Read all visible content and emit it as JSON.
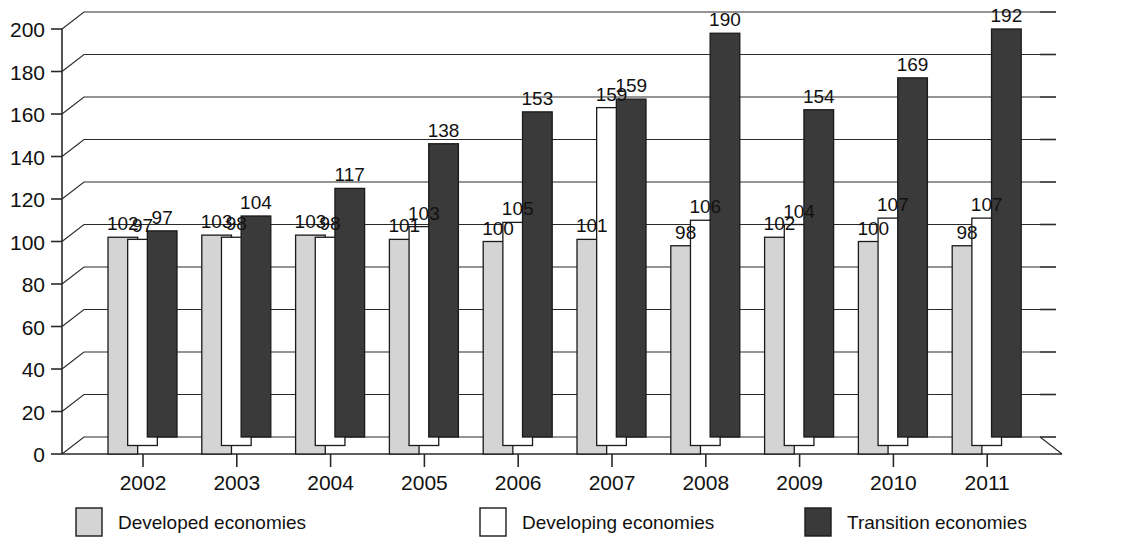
{
  "chart_data": {
    "type": "bar",
    "title": "",
    "subtitle": "",
    "xlabel": "",
    "ylabel": "",
    "ylim": [
      0,
      200
    ],
    "ytick_step": 20,
    "yticks": [
      "0",
      "20",
      "40",
      "60",
      "80",
      "100",
      "120",
      "140",
      "160",
      "180",
      "200"
    ],
    "grid": true,
    "grid_axis": "y",
    "legend_position": "bottom",
    "style": "3d-perspective-grouped-bar",
    "data_labels": true,
    "categories": [
      "2002",
      "2003",
      "2004",
      "2005",
      "2006",
      "2007",
      "2008",
      "2009",
      "2010",
      "2011"
    ],
    "series": [
      {
        "name": "Developed economies",
        "color": "#d4d4d4",
        "swatch": "light-gray",
        "values": [
          102,
          103,
          103,
          101,
          100,
          101,
          98,
          102,
          100,
          98
        ]
      },
      {
        "name": "Developing economies",
        "color": "#ffffff",
        "swatch": "white",
        "values": [
          97,
          98,
          98,
          103,
          105,
          159,
          106,
          104,
          107,
          107
        ]
      },
      {
        "name": "Transition economies",
        "color": "#3a3a3a",
        "swatch": "dark-gray",
        "values": [
          97,
          104,
          117,
          138,
          153,
          159,
          190,
          154,
          169,
          192
        ]
      }
    ]
  },
  "legend": {
    "items": [
      {
        "label": "Developed economies",
        "swatch_color": "#d4d4d4"
      },
      {
        "label": "Developing economies",
        "swatch_color": "#ffffff"
      },
      {
        "label": "Transition economies",
        "swatch_color": "#3a3a3a"
      }
    ]
  },
  "colors": {
    "developed": "#d4d4d4",
    "developing": "#ffffff",
    "transition": "#3a3a3a",
    "axis": "#2a2a2a",
    "background": "#ffffff",
    "text": "#111111"
  }
}
